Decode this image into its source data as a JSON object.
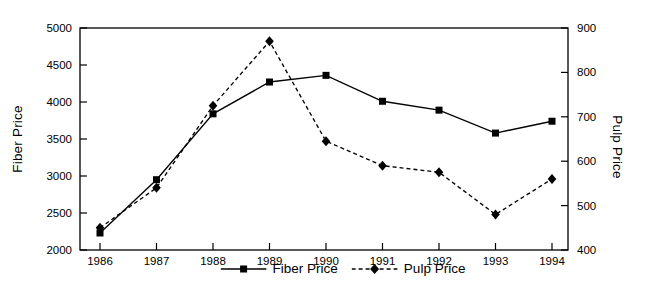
{
  "chart_data": {
    "type": "line",
    "title": "",
    "x": [
      "1986",
      "1987",
      "1988",
      "1989",
      "1990",
      "1991",
      "1992",
      "1993",
      "1994"
    ],
    "series": [
      {
        "name": "Fiber Price",
        "axis": "left",
        "line_style": "solid",
        "marker": "filled-square",
        "color": "#000000",
        "values": [
          2230,
          2950,
          3840,
          4270,
          4360,
          4010,
          3890,
          3580,
          3740
        ]
      },
      {
        "name": "Pulp Price",
        "axis": "right",
        "line_style": "dashed",
        "marker": "filled-diamond",
        "color": "#000000",
        "values": [
          450,
          540,
          725,
          870,
          645,
          590,
          575,
          480,
          560
        ]
      }
    ],
    "left_axis": {
      "label": "Fiber Price",
      "min": 2000,
      "max": 5000,
      "ticks": [
        2000,
        2500,
        3000,
        3500,
        4000,
        4500,
        5000
      ]
    },
    "right_axis": {
      "label": "Pulp Price",
      "min": 400,
      "max": 900,
      "ticks": [
        400,
        500,
        600,
        700,
        800,
        900
      ]
    },
    "x_axis": {
      "label": "",
      "ticks": [
        "1986",
        "1987",
        "1988",
        "1989",
        "1990",
        "1991",
        "1992",
        "1993",
        "1994"
      ]
    },
    "legend": {
      "position": "bottom-center",
      "entries": [
        {
          "label": "Fiber Price",
          "marker": "filled-square",
          "line": "solid"
        },
        {
          "label": "Pulp Price",
          "marker": "filled-diamond",
          "line": "dashed"
        }
      ]
    },
    "grid": false,
    "colors": {
      "line": "#000000",
      "text": "#000000",
      "background": "#ffffff"
    }
  }
}
